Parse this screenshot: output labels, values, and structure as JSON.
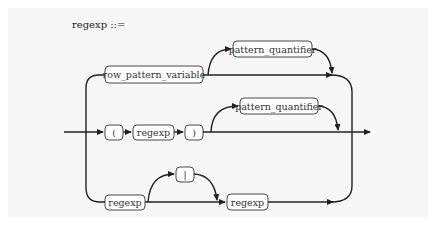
{
  "diagram": {
    "type": "railroad",
    "title": "regexp ::=",
    "caption": "",
    "alternatives": [
      {
        "name": "variable-branch",
        "nodes": [
          {
            "id": "row_pattern_variable",
            "label": "row_pattern_variable",
            "kind": "nonterminal"
          }
        ],
        "optional": {
          "id": "pattern_quantifier_1",
          "label": "pattern_quantifier",
          "kind": "nonterminal"
        }
      },
      {
        "name": "group-branch",
        "nodes": [
          {
            "id": "lparen",
            "label": "(",
            "kind": "terminal"
          },
          {
            "id": "regexp_inner",
            "label": "regexp",
            "kind": "nonterminal"
          },
          {
            "id": "rparen",
            "label": ")",
            "kind": "terminal"
          }
        ],
        "optional": {
          "id": "pattern_quantifier_2",
          "label": "pattern_quantifier",
          "kind": "nonterminal"
        }
      },
      {
        "name": "alternation-branch",
        "nodes": [
          {
            "id": "regexp_left",
            "label": "regexp",
            "kind": "nonterminal"
          },
          {
            "id": "regexp_right",
            "label": "regexp",
            "kind": "nonterminal"
          }
        ],
        "optional": {
          "id": "pipe",
          "label": "|",
          "kind": "terminal"
        }
      }
    ]
  },
  "labels": {
    "title": "regexp ::=",
    "row_pattern_variable": "row_pattern_variable",
    "pattern_quantifier_1": "pattern_quantifier",
    "lparen": "(",
    "regexp_inner": "regexp",
    "rparen": ")",
    "pattern_quantifier_2": "pattern_quantifier",
    "regexp_left": "regexp",
    "pipe": "|",
    "regexp_right": "regexp"
  },
  "colors": {
    "background": "#f7f7f7",
    "line": "#222222",
    "box_fill": "#ffffff",
    "box_stroke": "#333333"
  }
}
